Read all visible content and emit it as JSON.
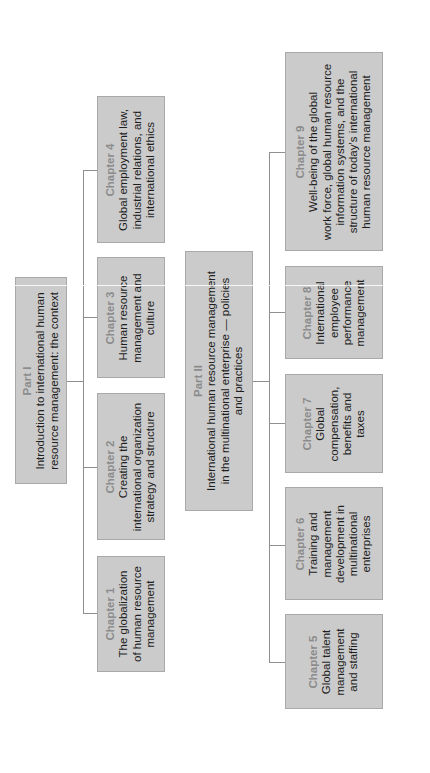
{
  "diagram": {
    "parts": [
      {
        "label": "Part I",
        "title_lines": [
          "Introduction to international human",
          "resource management: the context"
        ],
        "chapters": [
          {
            "label": "Chapter 1",
            "lines": [
              "The globalization",
              "of human resource",
              "management"
            ]
          },
          {
            "label": "Chapter 2",
            "lines": [
              "Creating the",
              "international organization",
              "strategy and structure"
            ]
          },
          {
            "label": "Chapter 3",
            "lines": [
              "Human resource",
              "management and",
              "culture"
            ]
          },
          {
            "label": "Chapter 4",
            "lines": [
              "Global employment law,",
              "industrial relations, and",
              "international ethics"
            ]
          }
        ]
      },
      {
        "label": "Part II",
        "title_lines": [
          "International human resource management",
          "in the multinational enterprise — policies",
          "and practices"
        ],
        "chapters": [
          {
            "label": "Chapter 5",
            "lines": [
              "Global talent",
              "management",
              "and staffing"
            ]
          },
          {
            "label": "Chapter 6",
            "lines": [
              "Training and",
              "management",
              "development in",
              "multinational",
              "enterprises"
            ]
          },
          {
            "label": "Chapter 7",
            "lines": [
              "Global",
              "compensation,",
              "benefits and",
              "taxes"
            ]
          },
          {
            "label": "Chapter 8",
            "lines": [
              "International",
              "employee",
              "performance",
              "management"
            ]
          },
          {
            "label": "Chapter 9",
            "lines": [
              "Well-being of the global",
              "work force, global human resource",
              "information systems, and the",
              "structure of today's international",
              "human resource management"
            ]
          }
        ]
      }
    ],
    "colors": {
      "box_fill": "#cbcbcb",
      "box_border": "#a9a9a9",
      "label": "#8c8c8c",
      "text": "#1e1e1e",
      "connector": "#8f8f8f"
    }
  }
}
